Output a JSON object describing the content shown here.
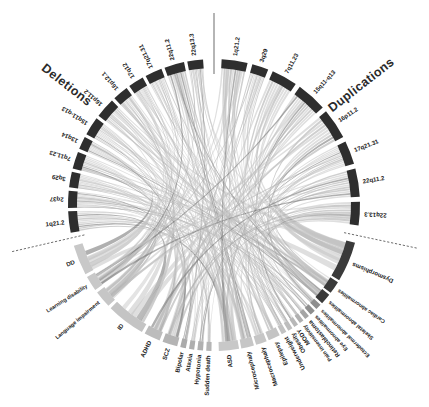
{
  "figure": {
    "type": "circos-chord-diagram",
    "title_left": "Deletions",
    "title_right": "Duplications",
    "background_color": "#ffffff",
    "center": {
      "x": 214,
      "y": 205
    },
    "outer_radius": 152,
    "arc_thickness": 9
  },
  "colors": {
    "cnv_arc": "#2e2e2e",
    "cnv_arc_alt": "#3d3d3d",
    "phenotype_arc_dark": "#3a3a3a",
    "phenotype_arc_mid": "#8e8e8e",
    "phenotype_arc_light": "#c9c9c9",
    "chord_light": "#c4c4c4",
    "chord_mid": "#a8a8a8",
    "chord_dark": "#6f6f6f",
    "label_text": "#1a1a1a",
    "divider": "#2b2b2b"
  },
  "chart_data": {
    "type": "chord",
    "groups": [
      {
        "name": "Deletions",
        "side": "left-top",
        "label": "Deletions"
      },
      {
        "name": "Duplications",
        "side": "right-top",
        "label": "Duplications"
      },
      {
        "name": "Phenotypes",
        "side": "bottom",
        "label": ""
      }
    ],
    "deletions": [
      {
        "label": "1q21.2",
        "size": 15,
        "color": "#2e2e2e"
      },
      {
        "label": "2q37",
        "size": 12,
        "color": "#2e2e2e"
      },
      {
        "label": "3q29",
        "size": 11,
        "color": "#2e2e2e"
      },
      {
        "label": "7q11.23",
        "size": 12,
        "color": "#2e2e2e"
      },
      {
        "label": "13q14",
        "size": 9,
        "color": "#2e2e2e"
      },
      {
        "label": "15q11-q13",
        "size": 13,
        "color": "#2e2e2e"
      },
      {
        "label": "16p11.2",
        "size": 14,
        "color": "#2e2e2e"
      },
      {
        "label": "16p12.1",
        "size": 11,
        "color": "#2e2e2e"
      },
      {
        "label": "17q12",
        "size": 11,
        "color": "#2e2e2e"
      },
      {
        "label": "17q21.31",
        "size": 12,
        "color": "#2e2e2e"
      },
      {
        "label": "22q11.2",
        "size": 14,
        "color": "#2e2e2e"
      },
      {
        "label": "22q13.3",
        "size": 11,
        "color": "#2e2e2e"
      }
    ],
    "duplications": [
      {
        "label": "1q21.2",
        "size": 11,
        "color": "#2e2e2e"
      },
      {
        "label": "3q29",
        "size": 7,
        "color": "#2e2e2e"
      },
      {
        "label": "7q11.23",
        "size": 11,
        "color": "#2e2e2e"
      },
      {
        "label": "15q11-q13",
        "size": 13,
        "color": "#2e2e2e"
      },
      {
        "label": "16p11.2",
        "size": 13,
        "color": "#2e2e2e"
      },
      {
        "label": "17q21.31",
        "size": 10,
        "color": "#2e2e2e"
      },
      {
        "label": "22q11.2",
        "size": 12,
        "color": "#2e2e2e"
      },
      {
        "label": "22q13.3",
        "size": 10,
        "color": "#2e2e2e"
      }
    ],
    "phenotypes_right": [
      {
        "label": "Dysmorphisms",
        "size": 22,
        "color": "#3a3a3a"
      },
      {
        "label": "Cardiac abnormalities",
        "size": 7,
        "color": "#3a3a3a"
      },
      {
        "label": "Skeletal abnormalities",
        "size": 6,
        "color": "#3a3a3a"
      },
      {
        "label": "Ectodermal abnormalities",
        "size": 3.2,
        "color": "#8e8e8e"
      },
      {
        "label": "Eye abnormalities",
        "size": 3.0,
        "color": "#8e8e8e"
      },
      {
        "label": "Retinoblastoma",
        "size": 2.6,
        "color": "#a5a5a5"
      },
      {
        "label": "Pain insensitivity",
        "size": 2.4,
        "color": "#b0b0b0"
      },
      {
        "label": "MODY",
        "size": 2.4,
        "color": "#b8b8b8"
      },
      {
        "label": "Obesity",
        "size": 2.6,
        "color": "#bdbdbd"
      },
      {
        "label": "Underweight",
        "size": 2.8,
        "color": "#c2c2c2"
      },
      {
        "label": "Epilepsy",
        "size": 6.5,
        "color": "#c4c4c4"
      },
      {
        "label": "Macrocephaly",
        "size": 6.0,
        "color": "#c6c6c6"
      },
      {
        "label": "Microcephaly",
        "size": 7.0,
        "color": "#c6c6c6"
      },
      {
        "label": "ASD",
        "size": 11,
        "color": "#c8c8c8"
      }
    ],
    "phenotypes_left": [
      {
        "label": "Sudden death",
        "size": 2.4,
        "color": "#b5b5b5"
      },
      {
        "label": "Hypotonia",
        "size": 2.6,
        "color": "#b0b0b0"
      },
      {
        "label": "Ataxia",
        "size": 2.4,
        "color": "#aeaeae"
      },
      {
        "label": "Bipolar",
        "size": 2.6,
        "color": "#ababab"
      },
      {
        "label": "SCZ",
        "size": 7.0,
        "color": "#b4b4b4"
      },
      {
        "label": "ADHD",
        "size": 7.5,
        "color": "#bcbcbc"
      },
      {
        "label": "ID",
        "size": 18,
        "color": "#c4c4c4"
      },
      {
        "label": "Language impairment",
        "size": 8.0,
        "color": "#c6c6c6"
      },
      {
        "label": "Learning disability",
        "size": 7.0,
        "color": "#c8c8c8"
      },
      {
        "label": "DD",
        "size": 14,
        "color": "#c8c8c8"
      }
    ],
    "legend_position": "none",
    "grid": false
  }
}
